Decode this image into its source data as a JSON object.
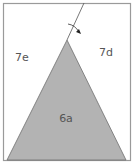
{
  "diagram": {
    "frame_color": "#9a9a9a",
    "triangle_fill": "#b3b3b3",
    "triangle_stroke": "#6e6e6e",
    "line_color": "#555555",
    "regions": [
      {
        "id": "left",
        "label": "7e"
      },
      {
        "id": "right",
        "label": "7d"
      },
      {
        "id": "triangle",
        "label": "6a"
      }
    ],
    "fold_arrow": "arrow-down-right"
  }
}
